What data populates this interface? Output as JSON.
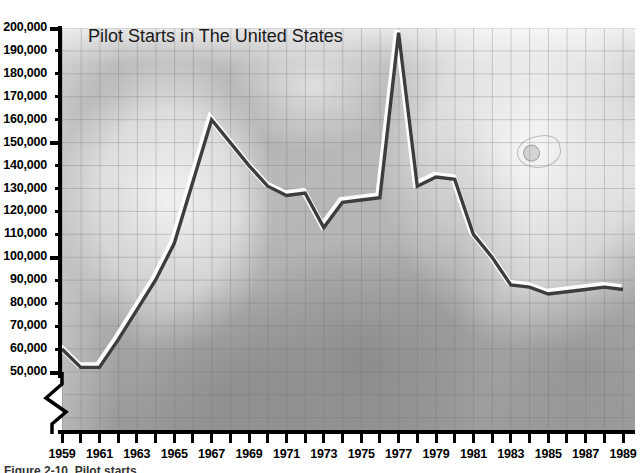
{
  "chart_data": {
    "type": "line",
    "title": "Pilot Starts in The United States",
    "xlabel": "",
    "ylabel": "",
    "grid": true,
    "legend": null,
    "y_axis_break": true,
    "ylim": [
      50000,
      200000
    ],
    "xlim": [
      1959,
      1989
    ],
    "y_ticks": [
      50000,
      60000,
      70000,
      80000,
      90000,
      100000,
      110000,
      120000,
      130000,
      140000,
      150000,
      160000,
      170000,
      180000,
      190000,
      200000
    ],
    "y_tick_labels": [
      "50,000",
      "60,000",
      "70,000",
      "80,000",
      "90,000",
      "100,000",
      "110,000",
      "120,000",
      "130,000",
      "140,000",
      "150,000",
      "160,000",
      "170,000",
      "180,000",
      "190,000",
      "200,000"
    ],
    "y_major_ticks": [
      50000,
      100000,
      150000,
      200000
    ],
    "x_tick_labels": [
      "1959",
      "1961",
      "1963",
      "1965",
      "1967",
      "1969",
      "1971",
      "1973",
      "1975",
      "1977",
      "1979",
      "1981",
      "1983",
      "1985",
      "1987",
      "1989"
    ],
    "x_all_years": [
      1959,
      1960,
      1961,
      1962,
      1963,
      1964,
      1965,
      1966,
      1967,
      1968,
      1969,
      1970,
      1971,
      1972,
      1973,
      1974,
      1975,
      1976,
      1977,
      1978,
      1979,
      1980,
      1981,
      1982,
      1983,
      1984,
      1985,
      1986,
      1987,
      1988,
      1989
    ],
    "x": [
      1959,
      1960,
      1961,
      1962,
      1963,
      1964,
      1965,
      1966,
      1967,
      1968,
      1969,
      1970,
      1971,
      1972,
      1973,
      1974,
      1975,
      1976,
      1977,
      1978,
      1979,
      1980,
      1981,
      1982,
      1983,
      1984,
      1985,
      1986,
      1987,
      1988,
      1989
    ],
    "values": [
      60000,
      52000,
      52000,
      64000,
      77000,
      90000,
      106000,
      133000,
      160000,
      150000,
      140000,
      131000,
      127000,
      128000,
      113000,
      124000,
      125000,
      126000,
      198000,
      131000,
      135000,
      134000,
      110000,
      100000,
      88000,
      87000,
      84000,
      85000,
      86000,
      87000,
      86000
    ],
    "series": [
      {
        "name": "Pilot Starts",
        "color": "#3d3d3d",
        "highlight_color": "#ffffff",
        "values": [
          60000,
          52000,
          52000,
          64000,
          77000,
          90000,
          106000,
          133000,
          160000,
          150000,
          140000,
          131000,
          127000,
          128000,
          113000,
          124000,
          125000,
          126000,
          198000,
          131000,
          135000,
          134000,
          110000,
          100000,
          88000,
          87000,
          84000,
          85000,
          86000,
          87000,
          86000
        ]
      }
    ],
    "annotations": []
  },
  "figure": {
    "caption": "Figure 2-10.  Pilot starts",
    "background_image": "pilot-in-cockpit-photo",
    "colors": {
      "plot_background": "#b9b9b9",
      "grid": "#6e6e6e",
      "axis": "#000000",
      "line": "#3d3d3d",
      "line_highlight": "#ffffff",
      "title_text": "#1a1a1a"
    }
  },
  "axis_break": {
    "name": "y-axis-break",
    "position_value": 50000,
    "shape": "zigzag"
  }
}
